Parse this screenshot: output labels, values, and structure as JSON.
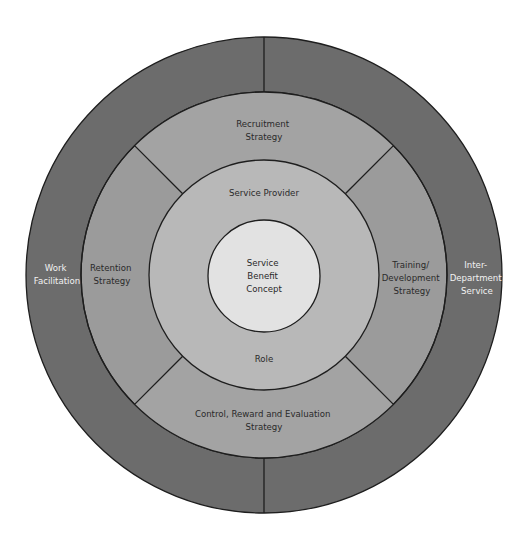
{
  "diagram": {
    "type": "concentric-rings",
    "colors": {
      "outer_ring": "#6c6c6c",
      "strategy_ring": "#9b9b9b",
      "provider_ring": "#b8b8b8",
      "core": "#e2e2e2",
      "stroke": "#1e1e1e",
      "background": "#ffffff"
    },
    "outer_ring": {
      "left_label": [
        "Work",
        "Facilitation"
      ],
      "right_label": [
        "Inter-",
        "Department",
        "Service"
      ]
    },
    "strategy_ring": {
      "top": [
        "Recruitment",
        "Strategy"
      ],
      "left": [
        "Retention",
        "Strategy"
      ],
      "right": [
        "Training/",
        "Development",
        "Strategy"
      ],
      "bottom": [
        "Control, Reward and Evaluation",
        "Strategy"
      ]
    },
    "provider_ring": {
      "top": "Service Provider",
      "bottom": "Role"
    },
    "core": [
      "Service",
      "Benefit",
      "Concept"
    ]
  }
}
